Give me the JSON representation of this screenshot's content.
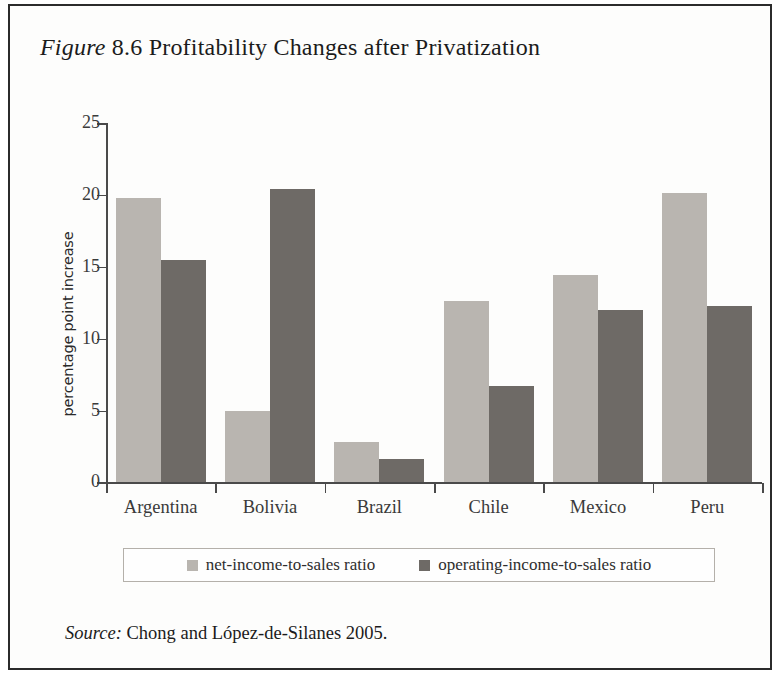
{
  "figure": {
    "label_italic": "Figure",
    "number": "8.6",
    "title": "Profitability Changes after Privatization",
    "full_title": "Figure 8.6 Profitability Changes after Privatization"
  },
  "source": {
    "label_italic": "Source:",
    "text": "Chong and López-de-Silanes 2005."
  },
  "colors": {
    "series_light": "#b9b5b0",
    "series_dark": "#6e6a66",
    "axis": "#4a4a4a",
    "frame": "#2b2b2b",
    "legend_border": "#b4b0aa",
    "page_background": "#fdfdfc"
  },
  "chart_data": {
    "type": "bar",
    "title": "Figure 8.6 Profitability Changes after Privatization",
    "subtitle": "",
    "xlabel": "",
    "ylabel": "percentage point increase",
    "categories": [
      "Argentina",
      "Bolivia",
      "Brazil",
      "Chile",
      "Mexico",
      "Peru"
    ],
    "series": [
      {
        "name": "net-income-to-sales ratio",
        "color": "#b9b5b0",
        "values": [
          19.8,
          5.0,
          2.8,
          12.6,
          14.4,
          20.1
        ]
      },
      {
        "name": "operating-income-to-sales ratio",
        "color": "#6e6a66",
        "values": [
          15.5,
          20.4,
          1.6,
          6.7,
          12.0,
          12.3
        ]
      }
    ],
    "ylim": [
      0,
      25
    ],
    "yticks": [
      0,
      5,
      10,
      15,
      20,
      25
    ],
    "ytick_labels": [
      "0",
      "5",
      "10",
      "15",
      "20",
      "25"
    ],
    "grid": false,
    "legend_position": "bottom",
    "legend_entries": [
      "net-income-to-sales ratio",
      "operating-income-to-sales ratio"
    ]
  }
}
